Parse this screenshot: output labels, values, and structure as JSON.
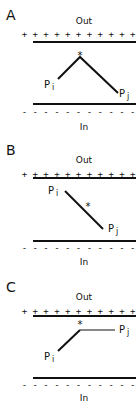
{
  "panels": [
    {
      "id": "A",
      "letter": "A",
      "out_label": "Out",
      "in_label": "In",
      "out_charges": "+ + + + + + + + + + + +",
      "in_charges": "- - - - - - - - - - - -",
      "point_i": "P",
      "point_i_sub": "i",
      "point_j": "P",
      "point_j_sub": "j",
      "star": "*",
      "shape": "inverted-V peak near outer membrane"
    },
    {
      "id": "B",
      "letter": "B",
      "out_label": "Out",
      "in_label": "In",
      "out_charges": "+ + + + + + + + + + + +",
      "in_charges": "- - - - - - - - - - - -",
      "point_i": "P",
      "point_i_sub": "i",
      "point_j": "P",
      "point_j_sub": "j",
      "star": "*",
      "shape": "straight diagonal from Pi (outer) to Pj (inner)"
    },
    {
      "id": "C",
      "letter": "C",
      "out_label": "Out",
      "in_label": "In",
      "out_charges": "+ + + + + + + + + + + +",
      "in_charges": "- - - - - - - - - - - -",
      "point_i": "P",
      "point_i_sub": "i",
      "point_j": "P",
      "point_j_sub": "j",
      "star": "*",
      "shape": "diagonal rise from Pi then flat segment to Pj"
    }
  ],
  "colors": {
    "ink": "#111111",
    "background": "#ffffff"
  }
}
